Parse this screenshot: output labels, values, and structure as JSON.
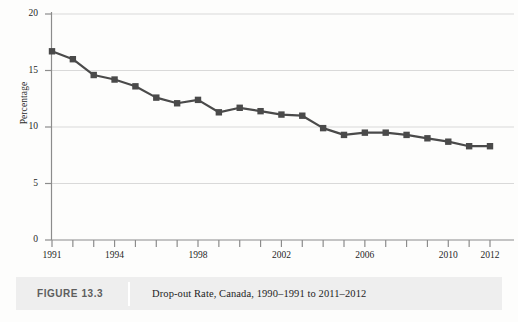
{
  "caption": {
    "figure_number": "FIGURE 13.3",
    "title": "Drop-out Rate, Canada, 1990–1991 to 2011–2012"
  },
  "colors": {
    "series_line": "#4a4a4a",
    "marker": "#4a4a4a",
    "gridline": "#d9d9d9",
    "axis": "#8c8c8c",
    "caption_background": "#eeeeee",
    "caption_number_text": "#5d5d5d",
    "caption_title_text": "#1d1d1d",
    "page_background": "#fdfdfc"
  },
  "chart_data": {
    "type": "line",
    "title": "Drop-out Rate, Canada, 1990–1991 to 2011–2012",
    "xlabel": "",
    "ylabel": "Percentage",
    "ylim": [
      0,
      20
    ],
    "yticks": [
      0,
      5,
      10,
      15,
      20
    ],
    "ytick_labels": [
      "0",
      "5",
      "10",
      "15",
      "20"
    ],
    "xlim": [
      1991,
      2012
    ],
    "xticks": [
      1991,
      1992,
      1993,
      1994,
      1995,
      1996,
      1997,
      1998,
      1999,
      2000,
      2001,
      2002,
      2003,
      2004,
      2005,
      2006,
      2007,
      2008,
      2009,
      2010,
      2011,
      2012
    ],
    "xtick_labels_shown": [
      "1991",
      "1994",
      "1998",
      "2002",
      "2006",
      "2010",
      "2012"
    ],
    "grid": true,
    "grid_axis": "y",
    "legend": false,
    "marker": "square",
    "x": [
      1991,
      1992,
      1993,
      1994,
      1995,
      1996,
      1997,
      1998,
      1999,
      2000,
      2001,
      2002,
      2003,
      2004,
      2005,
      2006,
      2007,
      2008,
      2009,
      2010,
      2011,
      2012
    ],
    "categories": [
      "1991",
      "1992",
      "1993",
      "1994",
      "1995",
      "1996",
      "1997",
      "1998",
      "1999",
      "2000",
      "2001",
      "2002",
      "2003",
      "2004",
      "2005",
      "2006",
      "2007",
      "2008",
      "2009",
      "2010",
      "2011",
      "2012"
    ],
    "values": [
      16.7,
      16.0,
      14.6,
      14.2,
      13.6,
      12.6,
      12.1,
      12.4,
      11.3,
      11.7,
      11.4,
      11.1,
      11.0,
      9.9,
      9.3,
      9.5,
      9.5,
      9.3,
      9.0,
      8.7,
      8.3,
      8.3
    ],
    "series": [
      {
        "name": "Drop-out rate",
        "values": [
          16.7,
          16.0,
          14.6,
          14.2,
          13.6,
          12.6,
          12.1,
          12.4,
          11.3,
          11.7,
          11.4,
          11.1,
          11.0,
          9.9,
          9.3,
          9.5,
          9.5,
          9.3,
          9.0,
          8.7,
          8.3,
          8.3
        ]
      }
    ]
  }
}
